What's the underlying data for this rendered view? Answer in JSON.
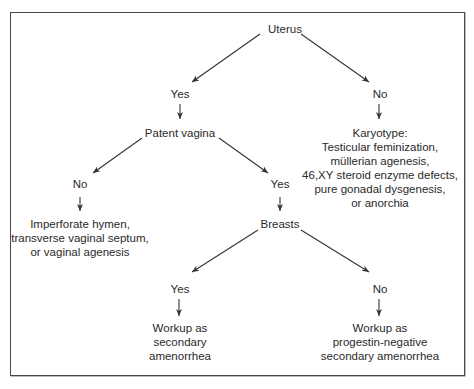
{
  "diagram": {
    "type": "decision-tree",
    "root": "Uterus",
    "nodes": {
      "uterus": {
        "label": "Uterus"
      },
      "uterus_yes": {
        "label": "Yes"
      },
      "uterus_no": {
        "label": "No"
      },
      "patent_vagina": {
        "label": "Patent vagina"
      },
      "karyotype": {
        "lines": [
          "Karyotype:",
          "Testicular feminization,",
          "müllerian agenesis,",
          "46,XY steroid enzyme defects,",
          "pure gonadal dysgenesis,",
          "or anorchia"
        ]
      },
      "vagina_no": {
        "label": "No"
      },
      "vagina_yes": {
        "label": "Yes"
      },
      "imperforate": {
        "lines": [
          "Imperforate hymen,",
          "transverse vaginal septum,",
          "or vaginal agenesis"
        ]
      },
      "breasts": {
        "label": "Breasts"
      },
      "breasts_yes": {
        "label": "Yes"
      },
      "breasts_no": {
        "label": "No"
      },
      "workup_secondary": {
        "lines": [
          "Workup as",
          "secondary",
          "amenorrhea"
        ]
      },
      "workup_progestin": {
        "lines": [
          "Workup as",
          "progestin-negative",
          "secondary amenorrhea"
        ]
      }
    },
    "edges": [
      {
        "from": "Uterus",
        "to": "Yes"
      },
      {
        "from": "Uterus",
        "to": "No"
      },
      {
        "from": "Yes",
        "to": "Patent vagina"
      },
      {
        "from": "No",
        "to": "Karyotype"
      },
      {
        "from": "Patent vagina",
        "to": "No"
      },
      {
        "from": "Patent vagina",
        "to": "Yes"
      },
      {
        "from": "No",
        "to": "Imperforate hymen, transverse vaginal septum, or vaginal agenesis"
      },
      {
        "from": "Yes",
        "to": "Breasts"
      },
      {
        "from": "Breasts",
        "to": "Yes"
      },
      {
        "from": "Breasts",
        "to": "No"
      },
      {
        "from": "Yes",
        "to": "Workup as secondary amenorrhea"
      },
      {
        "from": "No",
        "to": "Workup as progestin-negative secondary amenorrhea"
      }
    ],
    "colors": {
      "text": "#2a2a2a",
      "lines": "#333333",
      "border": "#4a4a4a",
      "background": "#ffffff"
    }
  }
}
